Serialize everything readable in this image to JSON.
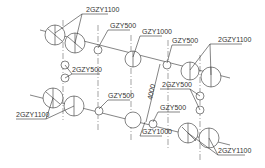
{
  "drawing": {
    "labels": {
      "top_2gzy1100_left": "2GZY1100",
      "top_gzy500_left": "GZY500",
      "top_2gzy500_left": "2GZY500",
      "top_gzy1000": "GZY1000",
      "top_gzy500_right": "GZY500",
      "top_2gzy1100_right": "2GZY1100",
      "dimension": "4000",
      "mid_2gzy500_right": "2GZY500",
      "mid_gzy500_center": "GZY500",
      "mid_gzy500_right": "GZY500",
      "bottom_2gzy1100_left": "2GZY1100",
      "bottom_gzy1000": "GZY1000",
      "bottom_2gzy1100_right": "2GZY1100"
    },
    "colors": {
      "line": "#333333",
      "background": "#ffffff"
    }
  }
}
